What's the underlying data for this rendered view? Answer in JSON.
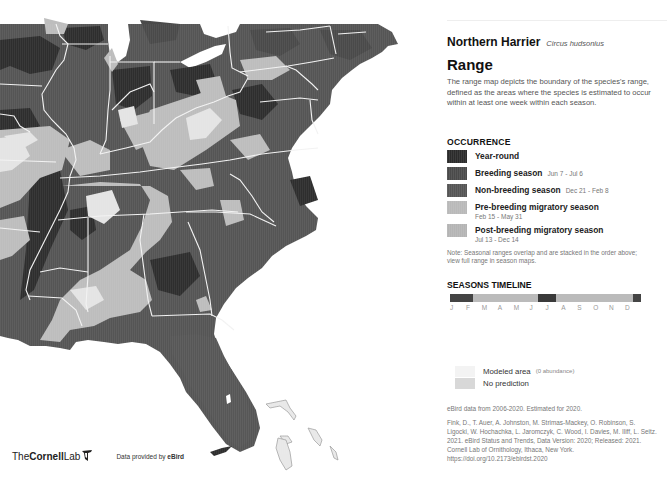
{
  "species": {
    "common_name": "Northern Harrier",
    "scientific_name": "Circus hudsonius"
  },
  "range": {
    "title": "Range",
    "description": "The range map depicts the boundary of the species's range, defined as the areas where the species is estimated to occur within at least one week within each season."
  },
  "occurrence": {
    "title": "OCCURRENCE",
    "items": [
      {
        "label": "Year-round",
        "dates": "",
        "color": "#2b2b2b"
      },
      {
        "label": "Breeding season",
        "dates": "Jun 7 - Jul 6",
        "color": "#4a4a4a"
      },
      {
        "label": "Non-breeding season",
        "dates": "Dec 21 - Feb 8",
        "color": "#555555"
      },
      {
        "label": "Pre-breeding migratory season",
        "dates": "Feb 15 - May 31",
        "color": "#b9b9b9"
      },
      {
        "label": "Post-breeding migratory season",
        "dates": "Jul 13 - Dec 14",
        "color": "#b4b4b4"
      }
    ],
    "note": "Note: Seasonal ranges overlap and are stacked in the order above; view full range in season maps."
  },
  "timeline": {
    "title": "SEASONS TIMELINE",
    "months": [
      "J",
      "F",
      "M",
      "A",
      "M",
      "J",
      "J",
      "A",
      "S",
      "O",
      "N",
      "D"
    ],
    "segments": [
      {
        "season": "non-breeding",
        "start": 0,
        "width": 12,
        "color": "#444444"
      },
      {
        "season": "pre-breeding",
        "start": 12,
        "width": 34,
        "color": "#bbbbbb"
      },
      {
        "season": "breeding",
        "start": 46,
        "width": 9.5,
        "color": "#3a3a3a"
      },
      {
        "season": "post-breeding",
        "start": 55.5,
        "width": 40.5,
        "color": "#bbbbbb"
      },
      {
        "season": "non-breeding",
        "start": 96,
        "width": 4,
        "color": "#444444"
      }
    ]
  },
  "prediction": {
    "modeled_label": "Modeled area",
    "modeled_sub": "(0 abundance)",
    "modeled_color": "#f3f3f3",
    "no_prediction_label": "No prediction",
    "no_prediction_color": "#d8d8d8"
  },
  "data_years": "eBird data from 2006-2020. Estimated for 2020.",
  "citation": "Fink, D., T. Auer, A. Johnston, M. Strimas-Mackey, O. Robinson, S. Ligocki, W. Hochachka, L. Jaromczyk, C. Wood, I. Davies, M. Iliff, L. Seitz. 2021. eBird Status and Trends, Data Version: 2020; Released: 2021. Cornell Lab of Ornithology, Ithaca, New York. https://doi.org/10.2173/ebirdst.2020",
  "branding": {
    "the": "The",
    "cornell": "Cornell",
    "lab": "Lab",
    "provided_by": "Data provided by",
    "ebird": "eBird"
  },
  "map": {
    "colors": {
      "year_round": "#2e2e2e",
      "breeding": "#4d4d4d",
      "non_breeding": "#585858",
      "migratory": "#bdbdbd",
      "modeled": "#e4e4e4",
      "water": "#ffffff",
      "borders": "#f2f2f2"
    }
  }
}
